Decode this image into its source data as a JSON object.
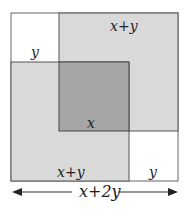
{
  "diagram": {
    "type": "nested-squares",
    "labels": {
      "top_right_square": "x+y",
      "top_left_corner": "y",
      "center_overlap": "x",
      "bottom_left_square": "x+y",
      "bottom_right_corner": "y",
      "total_width": "x+2y"
    },
    "colors": {
      "light_fill": "#d9d9d9",
      "dark_fill": "#a6a6a6",
      "stroke": "#555555",
      "background": "#ffffff"
    }
  }
}
